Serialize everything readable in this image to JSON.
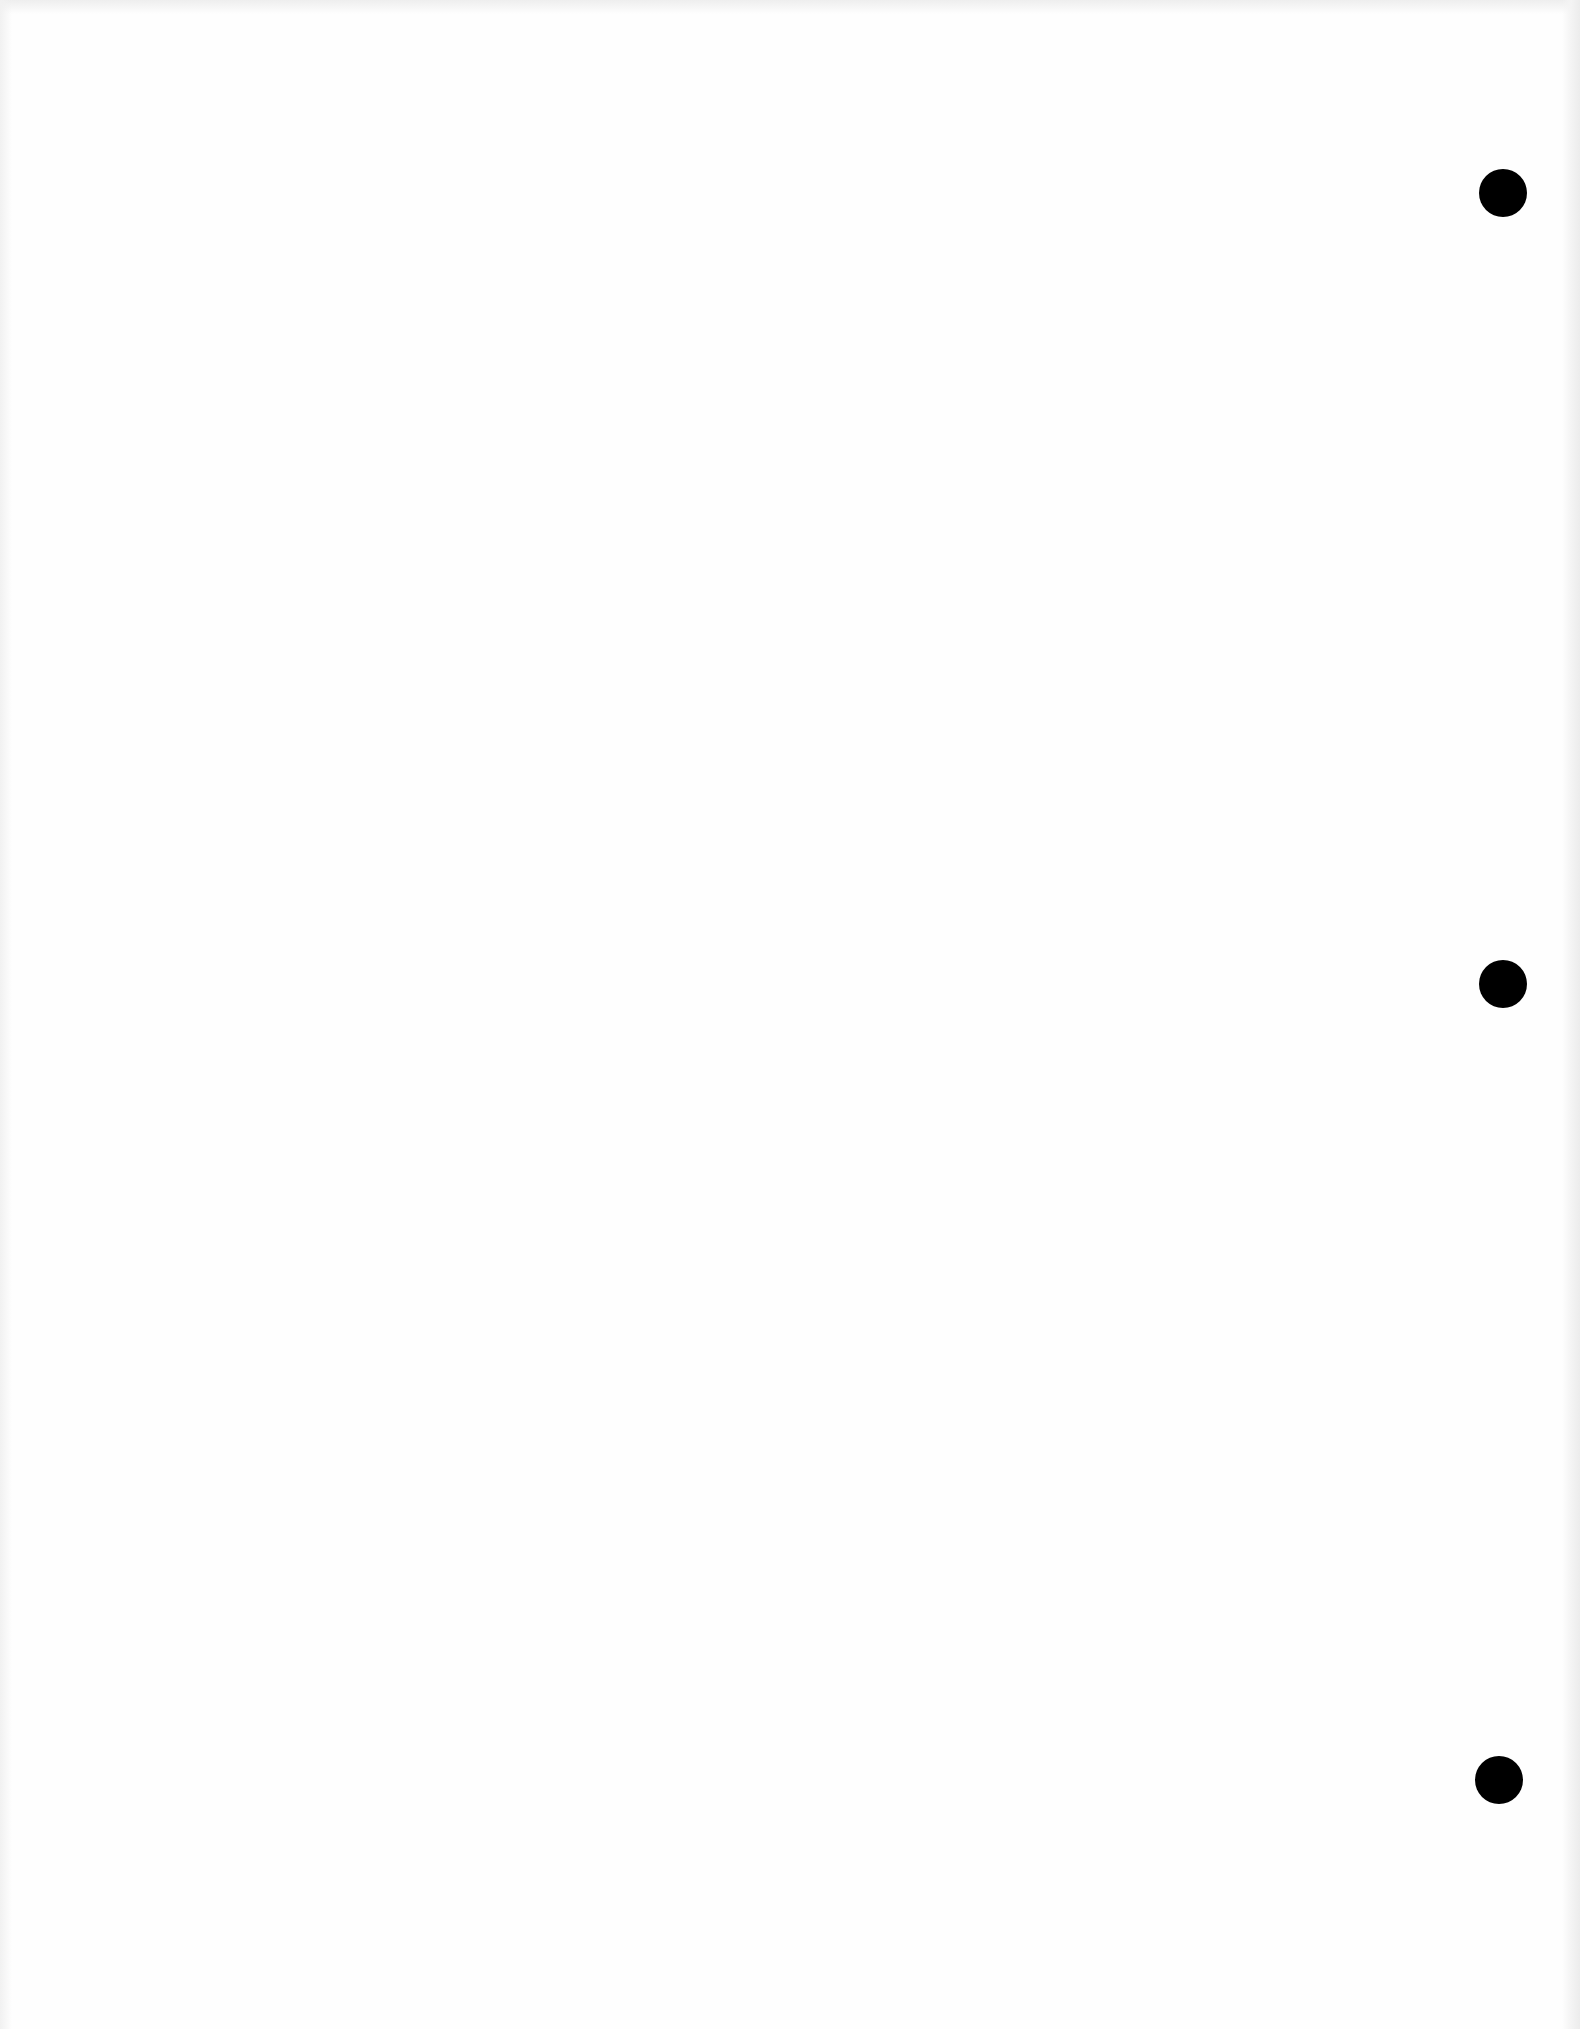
{
  "document": {
    "type": "scanned-blank-page",
    "background_color": "#fefefe",
    "text_content": ""
  },
  "punch_holes": [
    {
      "cx": 1503,
      "cy": 193,
      "diameter": 48,
      "color": "#000000"
    },
    {
      "cx": 1503,
      "cy": 984,
      "diameter": 48,
      "color": "#000000"
    },
    {
      "cx": 1499,
      "cy": 1780,
      "diameter": 48,
      "color": "#000000"
    }
  ]
}
